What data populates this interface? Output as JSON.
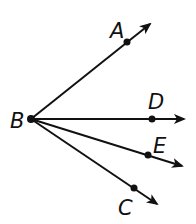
{
  "diagram": {
    "type": "rays-from-common-endpoint",
    "vertex": {
      "label": "B",
      "x": 31,
      "y": 119
    },
    "rays": [
      {
        "label": "A",
        "point": {
          "x": 127,
          "y": 42
        },
        "tip": {
          "x": 150,
          "y": 24
        },
        "label_pos": {
          "x": 110,
          "y": 38
        }
      },
      {
        "label": "D",
        "point": {
          "x": 152,
          "y": 119
        },
        "tip": {
          "x": 184,
          "y": 119
        },
        "label_pos": {
          "x": 148,
          "y": 109
        }
      },
      {
        "label": "E",
        "point": {
          "x": 148,
          "y": 155
        },
        "tip": {
          "x": 182,
          "y": 166
        },
        "label_pos": {
          "x": 153,
          "y": 153
        }
      },
      {
        "label": "C",
        "point": {
          "x": 134,
          "y": 188
        },
        "tip": {
          "x": 157,
          "y": 204
        },
        "label_pos": {
          "x": 118,
          "y": 215
        }
      }
    ],
    "vertex_label_pos": {
      "x": 10,
      "y": 128
    },
    "stroke_color": "#111111",
    "background": "#ffffff"
  }
}
